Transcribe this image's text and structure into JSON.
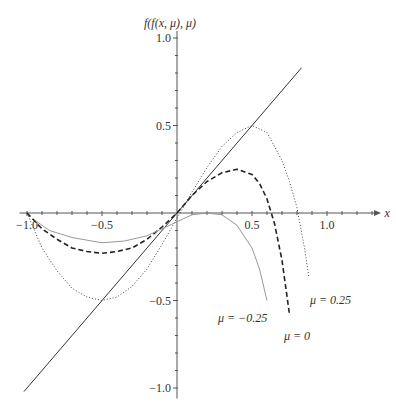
{
  "chart_data": {
    "type": "line",
    "title": "",
    "xlabel": "x",
    "ylabel": "f(f(x, μ), μ)",
    "xlim": [
      -1.0,
      1.35
    ],
    "ylim": [
      -1.05,
      1.05
    ],
    "grid": false,
    "x_ticks": [
      {
        "value": -1.0,
        "label": "−1.0"
      },
      {
        "value": -0.5,
        "label": "−0.5"
      },
      {
        "value": 0.5,
        "label": "0.5"
      },
      {
        "value": 1.0,
        "label": "1.0"
      }
    ],
    "y_ticks": [
      {
        "value": 1.0,
        "label": "1.0"
      },
      {
        "value": 0.5,
        "label": "0.5"
      },
      {
        "value": -0.5,
        "label": "−0.5"
      },
      {
        "value": -1.0,
        "label": "−1.0"
      }
    ],
    "series": [
      {
        "name": "identity",
        "label": "",
        "style": "solid",
        "color": "#333333",
        "points": [
          [
            -1.02,
            -1.02
          ],
          [
            0.83,
            0.83
          ]
        ]
      },
      {
        "name": "mu_0.25",
        "label": "μ = 0.25",
        "style": "dotted",
        "color": "#444444",
        "points": [
          [
            -1.0,
            0.0
          ],
          [
            -0.95,
            -0.1
          ],
          [
            -0.9,
            -0.2
          ],
          [
            -0.8,
            -0.33
          ],
          [
            -0.7,
            -0.43
          ],
          [
            -0.6,
            -0.48
          ],
          [
            -0.5,
            -0.5
          ],
          [
            -0.4,
            -0.48
          ],
          [
            -0.3,
            -0.42
          ],
          [
            -0.2,
            -0.32
          ],
          [
            -0.1,
            -0.18
          ],
          [
            0.0,
            -0.03
          ],
          [
            0.1,
            0.12
          ],
          [
            0.2,
            0.26
          ],
          [
            0.3,
            0.38
          ],
          [
            0.4,
            0.46
          ],
          [
            0.5,
            0.5
          ],
          [
            0.6,
            0.46
          ],
          [
            0.7,
            0.3
          ],
          [
            0.75,
            0.18
          ],
          [
            0.8,
            0.03
          ],
          [
            0.85,
            -0.2
          ],
          [
            0.88,
            -0.37
          ]
        ]
      },
      {
        "name": "mu_0",
        "label": "μ = 0",
        "style": "dashed",
        "color": "#222222",
        "points": [
          [
            -1.0,
            0.0
          ],
          [
            -0.9,
            -0.09
          ],
          [
            -0.8,
            -0.15
          ],
          [
            -0.7,
            -0.2
          ],
          [
            -0.6,
            -0.22
          ],
          [
            -0.5,
            -0.23
          ],
          [
            -0.4,
            -0.22
          ],
          [
            -0.3,
            -0.2
          ],
          [
            -0.2,
            -0.15
          ],
          [
            -0.1,
            -0.08
          ],
          [
            0.0,
            0.0
          ],
          [
            0.1,
            0.1
          ],
          [
            0.2,
            0.18
          ],
          [
            0.3,
            0.23
          ],
          [
            0.4,
            0.25
          ],
          [
            0.5,
            0.22
          ],
          [
            0.55,
            0.17
          ],
          [
            0.6,
            0.08
          ],
          [
            0.65,
            -0.06
          ],
          [
            0.7,
            -0.27
          ],
          [
            0.75,
            -0.58
          ]
        ]
      },
      {
        "name": "mu_-0.25",
        "label": "μ = −0.25",
        "style": "solid",
        "color": "#999999",
        "points": [
          [
            -0.95,
            -0.04
          ],
          [
            -0.85,
            -0.1
          ],
          [
            -0.7,
            -0.14
          ],
          [
            -0.5,
            -0.17
          ],
          [
            -0.35,
            -0.16
          ],
          [
            -0.2,
            -0.13
          ],
          [
            -0.1,
            -0.09
          ],
          [
            0.0,
            -0.05
          ],
          [
            0.1,
            -0.01
          ],
          [
            0.2,
            0.0
          ],
          [
            0.3,
            -0.01
          ],
          [
            0.4,
            -0.07
          ],
          [
            0.5,
            -0.2
          ],
          [
            0.55,
            -0.32
          ],
          [
            0.6,
            -0.5
          ]
        ]
      }
    ],
    "annotations": [
      {
        "text": "μ = 0.25",
        "series": "mu_0.25"
      },
      {
        "text": "μ = −0.25",
        "series": "mu_-0.25"
      },
      {
        "text": "μ = 0",
        "series": "mu_0"
      }
    ]
  }
}
